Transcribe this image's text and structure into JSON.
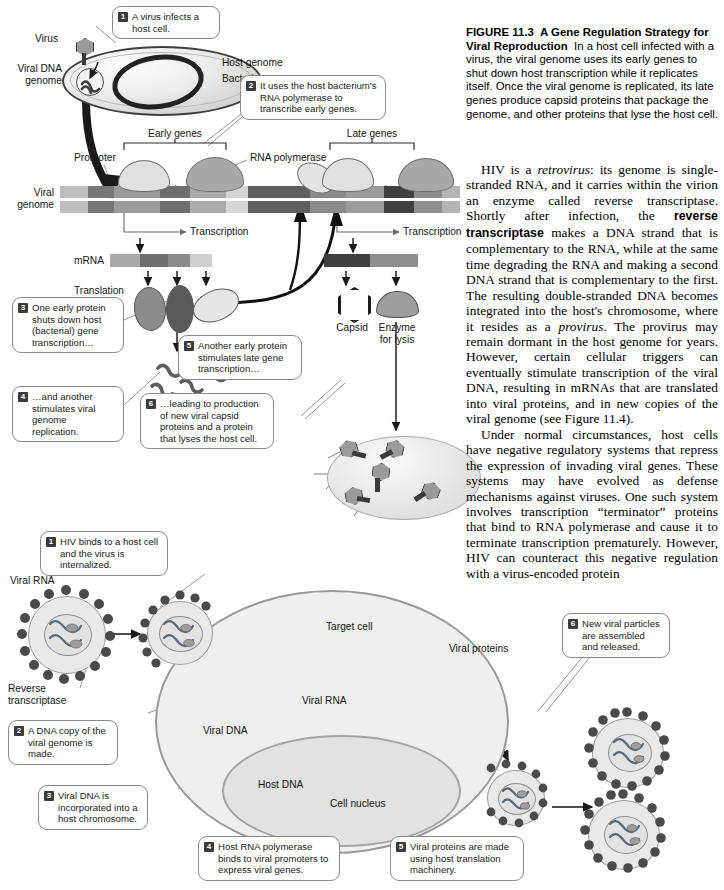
{
  "caption": {
    "figure_number": "FIGURE 11.3",
    "title": "A Gene Regulation Strategy for Viral Reproduction",
    "text": "In a host cell infected with a virus, the viral genome uses its early genes to shut down host transcription while it replicates itself. Once the viral genome is replicated, its late genes produce capsid proteins that package the genome, and other proteins that lyse the host cell."
  },
  "body": {
    "paragraph_1_a": "HIV is a ",
    "paragraph_1_retrovirus": "retrovirus",
    "paragraph_1_b": ": its genome is single-stranded RNA, and it carries within the virion an enzyme called reverse transcriptase. Shortly after infection, the ",
    "paragraph_1_bold": "reverse transcriptase",
    "paragraph_1_c": " makes a DNA strand that is complementary to the RNA, while at the same time degrading the RNA and making a second DNA strand that is complementary to the first. The resulting double-stranded DNA becomes integrated into the host's chromosome, where it resides as a ",
    "paragraph_1_provirus": "provirus",
    "paragraph_1_d": ". The provirus may remain dormant in the host genome for years. However, certain cellular triggers can eventually stimulate transcription of the viral DNA, resulting in mRNAs that are translated into viral proteins, and in new copies of the viral genome (see Figure 11.4).",
    "paragraph_2": "Under normal circumstances, host cells have negative regulatory systems that repress the expression of invading viral genes. These systems may have evolved as defense mechanisms against viruses. One such system involves transcription “terminator” proteins that bind to RNA polymerase and cause it to terminate transcription prematurely. However, HIV can counteract this negative regulation with a virus-encoded protein"
  },
  "top_diagram": {
    "labels": {
      "virus": "Virus",
      "viral_dna_genome": "Viral DNA\ngenome",
      "host_genome": "Host genome",
      "bacterium": "Bacterium",
      "early_genes": "Early genes",
      "late_genes": "Late genes",
      "promoter": "Promoter",
      "rna_polymerase": "RNA polymerase",
      "viral_genome": "Viral\ngenome",
      "transcription_left": "Transcription",
      "transcription_right": "Transcription",
      "mrna": "mRNA",
      "translation": "Translation",
      "capsid": "Capsid",
      "enzyme_for_lysis": "Enzyme\nfor lysis"
    },
    "steps": [
      {
        "num": "1",
        "text": "A virus infects a host cell."
      },
      {
        "num": "2",
        "text": "It uses the host bacterium's RNA polymerase to transcribe early genes."
      },
      {
        "num": "3",
        "text": "One early protein shuts down host (bacterial) gene transcription…"
      },
      {
        "num": "4",
        "text": "…and another stimulates viral genome replication."
      },
      {
        "num": "5",
        "text": "Another early protein stimulates late gene transcription…"
      },
      {
        "num": "6",
        "text": "…leading to production of new viral capsid proteins and a protein that lyses the host cell."
      }
    ]
  },
  "bottom_diagram": {
    "labels": {
      "viral_rna_left": "Viral RNA",
      "reverse_transcriptase": "Reverse\ntranscriptase",
      "target_cell": "Target cell",
      "viral_rna_inner": "Viral RNA",
      "viral_proteins": "Viral proteins",
      "viral_dna": "Viral DNA",
      "host_dna": "Host DNA",
      "cell_nucleus": "Cell nucleus"
    },
    "steps": [
      {
        "num": "1",
        "text": "HIV binds to a host cell and the virus is internalized."
      },
      {
        "num": "2",
        "text": "A DNA copy of the viral genome is made."
      },
      {
        "num": "3",
        "text": "Viral DNA is incorporated into a host chromosome."
      },
      {
        "num": "4",
        "text": "Host RNA polymerase binds to viral promoters to express viral genes."
      },
      {
        "num": "5",
        "text": "Viral proteins are made using host translation machinery."
      },
      {
        "num": "6",
        "text": "New viral particles are assembled and released."
      }
    ]
  },
  "colors": {
    "ink": "#111111",
    "balloon_border": "#8a8a8a",
    "step_badge": "#3a3a3a",
    "genome_dark": "#555555",
    "genome_mid": "#8d8d8d",
    "genome_light": "#c9c9c9",
    "cell_fill": "#efefef",
    "nucleus_fill": "#e2e2e2"
  }
}
